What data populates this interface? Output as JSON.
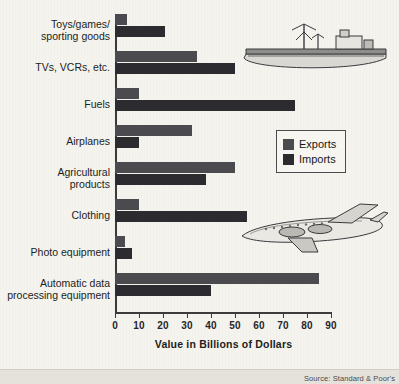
{
  "chart_data": {
    "type": "bar",
    "orientation": "horizontal",
    "title": "",
    "xlabel": "Value in Billions of Dollars",
    "ylabel": "",
    "xlim": [
      0,
      90
    ],
    "xticks": [
      0,
      10,
      20,
      30,
      40,
      50,
      60,
      70,
      80,
      90
    ],
    "grid": false,
    "legend_position": "right",
    "categories": [
      "Toys/games/\nsporting goods",
      "TVs, VCRs, etc.",
      "Fuels",
      "Airplanes",
      "Agricultural\nproducts",
      "Clothing",
      "Photo equipment",
      "Automatic data\nprocessing equipment"
    ],
    "series": [
      {
        "name": "Exports",
        "color": "#4a4a4f",
        "values": [
          5,
          34,
          10,
          32,
          50,
          10,
          4,
          85
        ]
      },
      {
        "name": "Imports",
        "color": "#2c2c30",
        "values": [
          21,
          50,
          75,
          10,
          38,
          55,
          7,
          40
        ]
      }
    ]
  },
  "legend": {
    "items": [
      {
        "label": "Exports"
      },
      {
        "label": "Imports"
      }
    ]
  },
  "source": {
    "text": "Source: Standard & Poor's"
  },
  "decor": {
    "ship": "cargo-ship-illustration",
    "plane": "airplane-illustration"
  }
}
